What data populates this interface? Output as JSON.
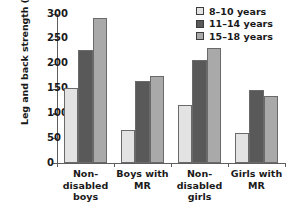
{
  "chart_data": {
    "type": "bar",
    "title": "",
    "xlabel": "",
    "ylabel": "Leg and back strength (kg)",
    "ylim": [
      0,
      300
    ],
    "yticks": [
      0,
      50,
      100,
      150,
      200,
      250,
      300
    ],
    "grid": false,
    "legend_position": "top-right",
    "categories": [
      "Non-\ndisabled\nboys",
      "Boys with\nMR",
      "Non-\ndisabled\ngirls",
      "Girls with\nMR"
    ],
    "series": [
      {
        "name": "8–10 years",
        "color": "#e3e3e3",
        "values": [
          152,
          66,
          117,
          61
        ]
      },
      {
        "name": "11–14 years",
        "color": "#595959",
        "values": [
          228,
          166,
          207,
          147
        ]
      },
      {
        "name": "15–18 years",
        "color": "#a9a9a9",
        "values": [
          292,
          176,
          231,
          134
        ]
      }
    ]
  },
  "legend": {
    "items": [
      {
        "label": "8–10 years",
        "color": "#e3e3e3"
      },
      {
        "label": "11–14 years",
        "color": "#595959"
      },
      {
        "label": "15–18 years",
        "color": "#a9a9a9"
      }
    ]
  },
  "axis": {
    "y_title": "Leg and back strength (kg)",
    "y_tick_labels": [
      "300",
      "250",
      "200",
      "150",
      "100",
      "50",
      "0"
    ]
  }
}
